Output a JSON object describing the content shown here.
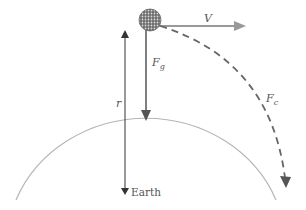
{
  "diagram": {
    "labels": {
      "velocity": "V",
      "gravity_force": "F",
      "gravity_sub": "g",
      "radius": "r",
      "centripetal_force": "F",
      "centripetal_sub": "c",
      "earth": "Earth"
    },
    "colors": {
      "arrow": "#8a8a8a",
      "dark_arrow": "#555555",
      "earth_arc": "#b0b0b0",
      "satellite": "#777777"
    }
  }
}
